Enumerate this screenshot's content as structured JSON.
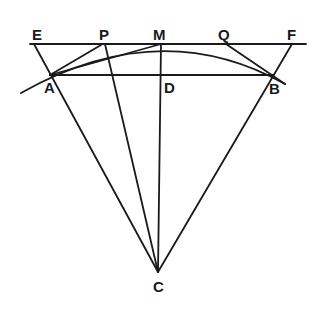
{
  "diagram": {
    "type": "geometry",
    "points": {
      "E": {
        "label": "E",
        "x": 34,
        "y": 44
      },
      "P": {
        "label": "P",
        "x": 105,
        "y": 44
      },
      "M": {
        "label": "M",
        "x": 161,
        "y": 44
      },
      "Q": {
        "label": "Q",
        "x": 226,
        "y": 44
      },
      "F": {
        "label": "F",
        "x": 292,
        "y": 44
      },
      "A": {
        "label": "A",
        "x": 50,
        "y": 75
      },
      "D": {
        "label": "D",
        "x": 161,
        "y": 75
      },
      "B": {
        "label": "B",
        "x": 273,
        "y": 75
      },
      "C": {
        "label": "C",
        "x": 158,
        "y": 272
      }
    },
    "labels": [
      "E",
      "P",
      "M",
      "Q",
      "F",
      "A",
      "D",
      "B",
      "C"
    ]
  }
}
